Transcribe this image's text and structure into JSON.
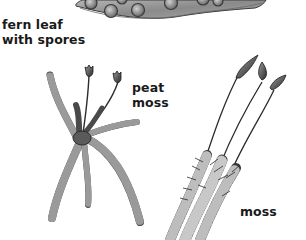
{
  "labels": {
    "fern_leaf": {
      "line1": "fern leaf",
      "line2": "with spores"
    },
    "peat_moss": {
      "line1": "peat",
      "line2": "moss"
    },
    "moss": {
      "line1": "moss"
    }
  },
  "colors": {
    "background": "#ffffff",
    "text": "#1a1a1a",
    "leaf_fill": "#8c8c8c",
    "leaf_outline": "#3a3a3a",
    "spore_fill": "#9a9a9a",
    "plant_dark": "#2b2b2b",
    "plant_mid": "#6e6e6e"
  }
}
